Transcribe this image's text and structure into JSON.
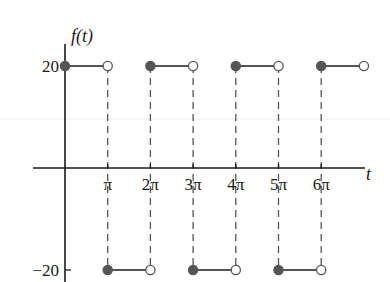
{
  "chart_data": {
    "type": "line",
    "subtype": "step / piecewise-constant square wave",
    "title": "",
    "xlabel": "t",
    "ylabel": "f(t)",
    "x_unit": "π",
    "x_tick_labels": [
      "π",
      "2π",
      "3π",
      "4π",
      "5π",
      "6π"
    ],
    "x_ticks": [
      1,
      2,
      3,
      4,
      5,
      6
    ],
    "y_tick_labels": [
      "20",
      "−20"
    ],
    "y_ticks": [
      20,
      -20
    ],
    "xlim": [
      -0.7,
      7.0
    ],
    "ylim": [
      -20,
      20
    ],
    "grid": false,
    "legend": null,
    "segments": [
      {
        "x_start": 0,
        "x_end": 1,
        "y": 20,
        "start_closed": true,
        "end_closed": false
      },
      {
        "x_start": 1,
        "x_end": 2,
        "y": -20,
        "start_closed": true,
        "end_closed": false
      },
      {
        "x_start": 2,
        "x_end": 3,
        "y": 20,
        "start_closed": true,
        "end_closed": false
      },
      {
        "x_start": 3,
        "x_end": 4,
        "y": -20,
        "start_closed": true,
        "end_closed": false
      },
      {
        "x_start": 4,
        "x_end": 5,
        "y": 20,
        "start_closed": true,
        "end_closed": false
      },
      {
        "x_start": 5,
        "x_end": 6,
        "y": -20,
        "start_closed": true,
        "end_closed": false
      },
      {
        "x_start": 6,
        "x_end": 7,
        "y": 20,
        "start_closed": true,
        "end_closed": false
      }
    ],
    "annotations": [
      "dashed vertical lines at each multiple of π connecting the +20 and −20 levels"
    ],
    "colors": {
      "axis": "#1a1a1a",
      "segment": "#555555",
      "filled_dot": "#555555",
      "open_dot_stroke": "#555555",
      "dashed": "#555555"
    }
  }
}
